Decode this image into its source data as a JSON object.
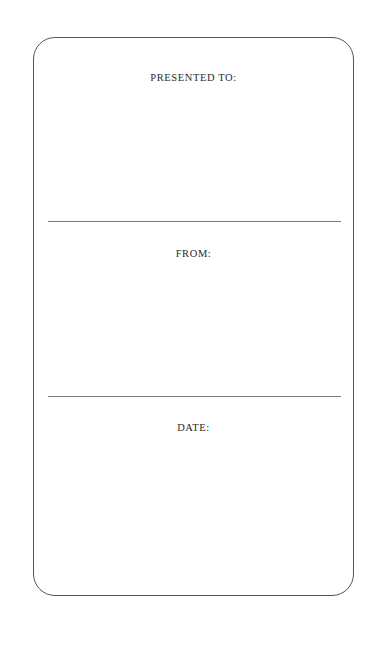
{
  "document": {
    "type": "presentation-card",
    "sections": [
      {
        "label": "PRESENTED TO:",
        "value": ""
      },
      {
        "label": "FROM:",
        "value": ""
      },
      {
        "label": "DATE:",
        "value": ""
      }
    ]
  },
  "colors": {
    "background": "#ffffff",
    "border": "#555555",
    "divider": "#7a7a7a",
    "text": "#2a2a2a"
  }
}
